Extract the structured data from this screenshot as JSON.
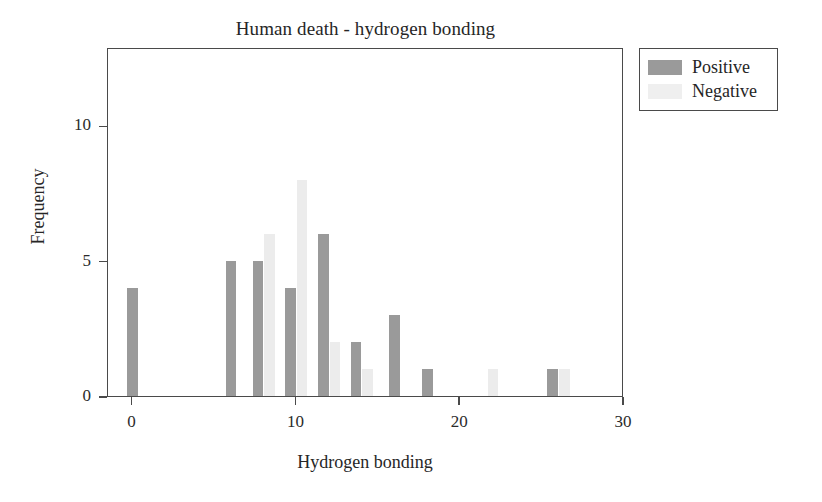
{
  "chart_data": {
    "type": "bar",
    "title": "Human death - hydrogen bonding",
    "xlabel": "Hydrogen bonding",
    "ylabel": "Frequency",
    "xlim": [
      -1.5,
      30
    ],
    "ylim": [
      0,
      12.9
    ],
    "grid": false,
    "legend_position": "outside-top-right",
    "x_ticks": [
      {
        "value": 0,
        "label": "0"
      },
      {
        "value": 10,
        "label": "10"
      },
      {
        "value": 20,
        "label": "20"
      },
      {
        "value": 30,
        "label": "30"
      }
    ],
    "y_ticks": [
      {
        "value": 0,
        "label": "0"
      },
      {
        "value": 5,
        "label": "5"
      },
      {
        "value": 10,
        "label": "10"
      }
    ],
    "series": [
      {
        "name": "Positive",
        "color": "#9a9a9a",
        "points": [
          {
            "x": 0,
            "y": 4
          },
          {
            "x": 6,
            "y": 5
          },
          {
            "x": 8,
            "y": 5
          },
          {
            "x": 10,
            "y": 4
          },
          {
            "x": 12,
            "y": 6
          },
          {
            "x": 14,
            "y": 2
          },
          {
            "x": 16,
            "y": 3
          },
          {
            "x": 18,
            "y": 1
          },
          {
            "x": 26,
            "y": 1
          }
        ]
      },
      {
        "name": "Negative",
        "color": "#ececec",
        "points": [
          {
            "x": 8,
            "y": 6
          },
          {
            "x": 10,
            "y": 8
          },
          {
            "x": 12,
            "y": 2
          },
          {
            "x": 14,
            "y": 1
          },
          {
            "x": 22,
            "y": 1
          },
          {
            "x": 26,
            "y": 1
          }
        ]
      }
    ]
  },
  "legend": {
    "items": [
      {
        "label": "Positive",
        "kind": "positive"
      },
      {
        "label": "Negative",
        "kind": "negative"
      }
    ]
  }
}
